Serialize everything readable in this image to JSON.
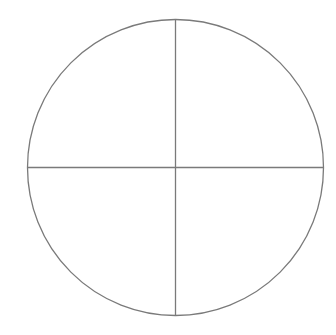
{
  "diagram": {
    "type": "quartered-circle",
    "quadrant_count": 4,
    "stroke_color": "#7a7a7a",
    "background_color": "#ffffff",
    "geometry": {
      "center_x": 175.5,
      "center_y": 167.5,
      "radius": 148,
      "stroke_width": 1.3
    }
  }
}
